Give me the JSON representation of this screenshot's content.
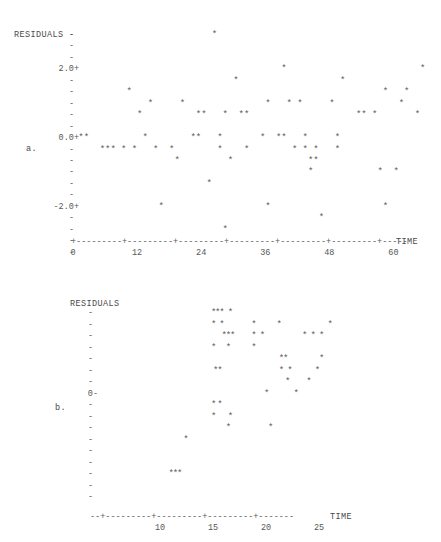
{
  "chart_data": [
    {
      "id": "a",
      "type": "scatter",
      "panel_label": "a.",
      "title": "",
      "ylabel": "RESIDUALS",
      "xlabel": "TIME",
      "marker": "*",
      "grid": false,
      "legend": "none",
      "xlim": [
        -1,
        68
      ],
      "ylim": [
        -3.6,
        3.1
      ],
      "xticks": [
        0,
        12,
        24,
        36,
        48,
        60
      ],
      "xtick_labels": [
        "0",
        "12",
        "24",
        "36",
        "48",
        "60"
      ],
      "yticks": [
        2.0,
        0.0,
        -2.0
      ],
      "ytick_labels": [
        "2.0+",
        "0.0+",
        "-2.0+"
      ],
      "ytick_minor_glyph": "-",
      "ytick_major_glyph": "+",
      "y_row_values": [
        3.0,
        2.666,
        2.333,
        2.0,
        1.666,
        1.333,
        1.0,
        0.666,
        0.333,
        0.0,
        -0.333,
        -0.666,
        -1.0,
        -1.333,
        -1.666,
        -2.0,
        -2.333,
        -2.666,
        -3.0,
        -3.333
      ],
      "axis_line": "+---------+---------+---------+---------+---------+---------+-----",
      "points": [
        {
          "x": 1,
          "y": 0.0
        },
        {
          "x": 2,
          "y": 0.0
        },
        {
          "x": 5,
          "y": -0.333
        },
        {
          "x": 6,
          "y": -0.333
        },
        {
          "x": 7,
          "y": -0.333
        },
        {
          "x": 9,
          "y": -0.333
        },
        {
          "x": 10,
          "y": 1.333
        },
        {
          "x": 11,
          "y": -0.333
        },
        {
          "x": 12,
          "y": 0.666
        },
        {
          "x": 13,
          "y": 0.0
        },
        {
          "x": 14,
          "y": 1.0
        },
        {
          "x": 15,
          "y": -0.333
        },
        {
          "x": 16,
          "y": -2.0
        },
        {
          "x": 18,
          "y": -0.333
        },
        {
          "x": 19,
          "y": -0.666
        },
        {
          "x": 20,
          "y": 1.0
        },
        {
          "x": 22,
          "y": 0.0
        },
        {
          "x": 23,
          "y": 0.0
        },
        {
          "x": 23,
          "y": 0.666
        },
        {
          "x": 24,
          "y": 0.666
        },
        {
          "x": 25,
          "y": -1.333
        },
        {
          "x": 26,
          "y": 3.0
        },
        {
          "x": 27,
          "y": -0.333
        },
        {
          "x": 27,
          "y": 0.0
        },
        {
          "x": 28,
          "y": 0.666
        },
        {
          "x": 28,
          "y": -2.666
        },
        {
          "x": 29,
          "y": -0.666
        },
        {
          "x": 30,
          "y": 1.666
        },
        {
          "x": 31,
          "y": 0.666
        },
        {
          "x": 32,
          "y": 0.666
        },
        {
          "x": 32,
          "y": -0.333
        },
        {
          "x": 35,
          "y": 0.0
        },
        {
          "x": 36,
          "y": 1.0
        },
        {
          "x": 36,
          "y": -2.0
        },
        {
          "x": 38,
          "y": 0.0
        },
        {
          "x": 39,
          "y": 0.0
        },
        {
          "x": 39,
          "y": 2.0
        },
        {
          "x": 40,
          "y": 1.0
        },
        {
          "x": 41,
          "y": -0.333
        },
        {
          "x": 42,
          "y": 1.0
        },
        {
          "x": 43,
          "y": 0.0
        },
        {
          "x": 43,
          "y": -0.333
        },
        {
          "x": 44,
          "y": -1.0
        },
        {
          "x": 44,
          "y": -0.666
        },
        {
          "x": 45,
          "y": -0.666
        },
        {
          "x": 45,
          "y": -0.333
        },
        {
          "x": 46,
          "y": -2.333
        },
        {
          "x": 48,
          "y": 1.0
        },
        {
          "x": 49,
          "y": 0.0
        },
        {
          "x": 49,
          "y": -0.333
        },
        {
          "x": 50,
          "y": 1.666
        },
        {
          "x": 53,
          "y": 0.666
        },
        {
          "x": 54,
          "y": 0.666
        },
        {
          "x": 56,
          "y": 0.666
        },
        {
          "x": 57,
          "y": -1.0
        },
        {
          "x": 58,
          "y": 1.333
        },
        {
          "x": 58,
          "y": -2.0
        },
        {
          "x": 60,
          "y": -1.0
        },
        {
          "x": 61,
          "y": 1.0
        },
        {
          "x": 62,
          "y": 1.333
        },
        {
          "x": 64,
          "y": 0.666
        },
        {
          "x": 65,
          "y": 2.0
        }
      ]
    },
    {
      "id": "b",
      "type": "scatter",
      "panel_label": "b.",
      "title": "",
      "ylabel": "RESIDUALS",
      "xlabel": "TIME",
      "marker": "*",
      "grid": false,
      "legend": "none",
      "xlim": [
        8.6,
        27.6
      ],
      "ylim": [
        -9,
        8
      ],
      "xticks": [
        10,
        15,
        20,
        25
      ],
      "xtick_labels": [
        "10",
        "15",
        "20",
        "25"
      ],
      "yticks": [
        0
      ],
      "ytick_labels": [
        "0-"
      ],
      "ytick_minor_glyph": "-",
      "ytick_major_glyph": "-",
      "y_row_values": [
        7,
        6,
        5,
        4,
        3,
        2,
        1,
        0,
        -1,
        -2,
        -3,
        -4,
        -5,
        -6,
        -7,
        -8,
        -9
      ],
      "axis_line": "--+---------+---------+---------+-------",
      "points": [
        {
          "x": 14.8,
          "y": 7
        },
        {
          "x": 15.2,
          "y": 7
        },
        {
          "x": 15.6,
          "y": 7
        },
        {
          "x": 16.4,
          "y": 7
        },
        {
          "x": 14.8,
          "y": 6
        },
        {
          "x": 15.6,
          "y": 6
        },
        {
          "x": 18.6,
          "y": 6
        },
        {
          "x": 21.0,
          "y": 6
        },
        {
          "x": 25.8,
          "y": 6
        },
        {
          "x": 15.8,
          "y": 5
        },
        {
          "x": 16.2,
          "y": 5
        },
        {
          "x": 16.6,
          "y": 5
        },
        {
          "x": 18.6,
          "y": 5
        },
        {
          "x": 19.4,
          "y": 5
        },
        {
          "x": 23.4,
          "y": 5
        },
        {
          "x": 24.2,
          "y": 5
        },
        {
          "x": 25.0,
          "y": 5
        },
        {
          "x": 14.8,
          "y": 4
        },
        {
          "x": 16.2,
          "y": 4
        },
        {
          "x": 18.6,
          "y": 4
        },
        {
          "x": 21.2,
          "y": 3
        },
        {
          "x": 21.6,
          "y": 3
        },
        {
          "x": 25.0,
          "y": 3
        },
        {
          "x": 15.0,
          "y": 2
        },
        {
          "x": 15.4,
          "y": 2
        },
        {
          "x": 21.2,
          "y": 2
        },
        {
          "x": 22.0,
          "y": 2
        },
        {
          "x": 24.6,
          "y": 2
        },
        {
          "x": 21.8,
          "y": 1
        },
        {
          "x": 23.8,
          "y": 1
        },
        {
          "x": 19.8,
          "y": 0
        },
        {
          "x": 22.6,
          "y": 0
        },
        {
          "x": 14.8,
          "y": -1
        },
        {
          "x": 15.4,
          "y": -1
        },
        {
          "x": 14.8,
          "y": -2
        },
        {
          "x": 16.4,
          "y": -2
        },
        {
          "x": 16.2,
          "y": -3
        },
        {
          "x": 20.2,
          "y": -3
        },
        {
          "x": 12.2,
          "y": -4
        },
        {
          "x": 10.8,
          "y": -7
        },
        {
          "x": 11.2,
          "y": -7
        },
        {
          "x": 11.6,
          "y": -7
        }
      ]
    }
  ]
}
